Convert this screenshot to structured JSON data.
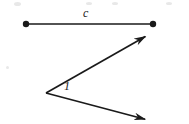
{
  "figure": {
    "type": "geometry-diagram",
    "canvas": {
      "width": 189,
      "height": 124
    },
    "colors": {
      "background": "#ffffff",
      "ink": "#1a1a1a",
      "speck": "#e8e8e8"
    },
    "segment": {
      "label": "c",
      "label_position": {
        "x": 88,
        "y": 14
      },
      "stroke_width": 1.7,
      "endpoints": [
        {
          "name": "left-endpoint",
          "x": 26,
          "y": 24,
          "dot_radius": 3.2
        },
        {
          "name": "right-endpoint",
          "x": 153,
          "y": 24,
          "dot_radius": 3.2
        }
      ]
    },
    "angle": {
      "label": "1",
      "label_position": {
        "x": 67,
        "y": 87
      },
      "vertex": {
        "x": 46,
        "y": 93
      },
      "stroke_width": 1.7,
      "rays": [
        {
          "name": "upper-ray",
          "from": {
            "x": 46,
            "y": 93
          },
          "to": {
            "x": 148,
            "y": 35
          },
          "arrowhead": true
        },
        {
          "name": "lower-ray",
          "from": {
            "x": 46,
            "y": 93
          },
          "to": {
            "x": 148,
            "y": 120
          },
          "arrowhead": true
        }
      ]
    },
    "specks": [
      {
        "x": 14,
        "y": 2,
        "w": 7,
        "h": 4
      },
      {
        "x": 86,
        "y": 2,
        "w": 6,
        "h": 3
      },
      {
        "x": 112,
        "y": 2,
        "w": 6,
        "h": 3
      },
      {
        "x": 166,
        "y": 2,
        "w": 6,
        "h": 3
      },
      {
        "x": 6,
        "y": 66,
        "w": 3,
        "h": 3
      }
    ]
  }
}
